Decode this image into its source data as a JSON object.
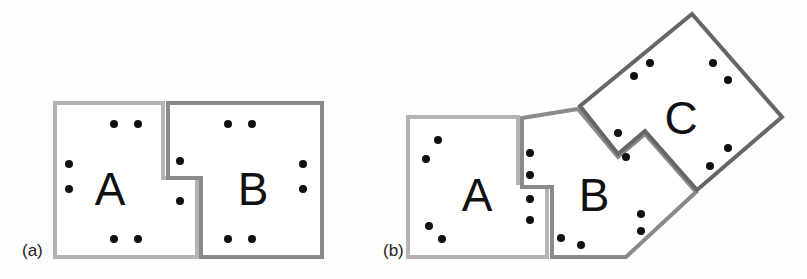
{
  "diagram": {
    "colors": {
      "region_A_border": "#b4b4b4",
      "region_B_border": "#8a8a8a",
      "region_C_border": "#666666",
      "dot": "#111111",
      "background": "#fdfdfd"
    },
    "panels": [
      {
        "id": "a",
        "label": "(a)",
        "regions": [
          {
            "name": "A",
            "label": "A"
          },
          {
            "name": "B",
            "label": "B"
          }
        ]
      },
      {
        "id": "b",
        "label": "(b)",
        "regions": [
          {
            "name": "A",
            "label": "A"
          },
          {
            "name": "B",
            "label": "B"
          },
          {
            "name": "C",
            "label": "C"
          }
        ]
      }
    ]
  }
}
